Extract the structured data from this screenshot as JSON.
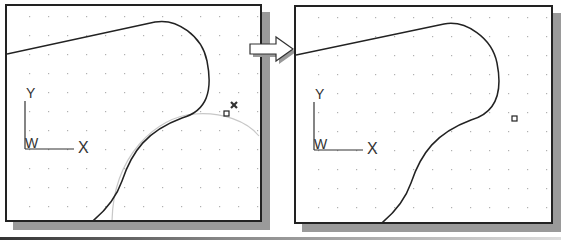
{
  "diagram": {
    "type": "cad-viewport-comparison",
    "panels": [
      {
        "id": "before",
        "coord_icon": {
          "y_label": "Y",
          "x_label": "X",
          "w_label": "W"
        },
        "markers": [
          "snap-square",
          "cross-marker",
          "construction-arc"
        ]
      },
      {
        "id": "after",
        "coord_icon": {
          "y_label": "Y",
          "x_label": "X",
          "w_label": "W"
        },
        "markers": [
          "snap-square"
        ]
      }
    ],
    "colors": {
      "frame_border": "#222222",
      "shadow": "#9a9a9a",
      "curve": "#222222",
      "construction_arc": "#c8c8c8",
      "grid_dot": "#b0b0b0"
    }
  }
}
